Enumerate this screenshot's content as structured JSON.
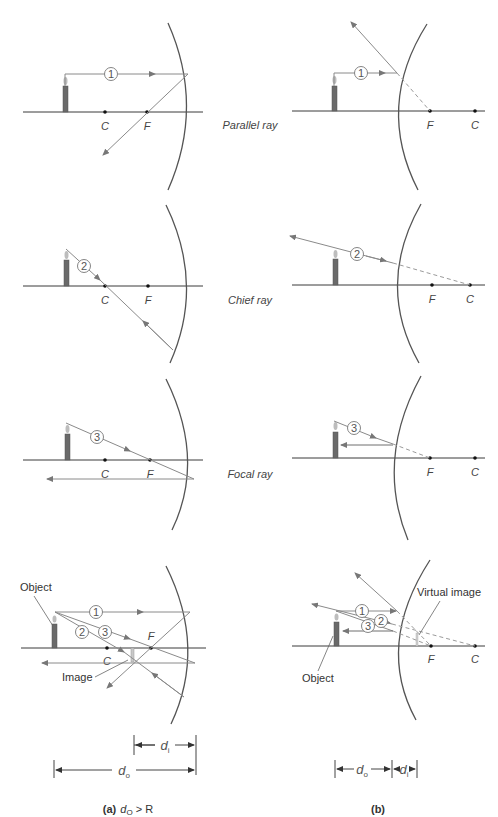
{
  "ray_labels": {
    "parallel": "Parallel ray",
    "chief": "Chief ray",
    "focal": "Focal ray"
  },
  "ray_numbers": {
    "one": "1",
    "two": "2",
    "three": "3"
  },
  "points": {
    "center": "C",
    "focus": "F"
  },
  "callouts": {
    "object": "Object",
    "image": "Image",
    "virtual_image": "Virtual image"
  },
  "dimensions": {
    "d": "d",
    "o_sub": "o",
    "i_sub": "i"
  },
  "captions": {
    "a_tag": "(a)",
    "a_condition_d": "d",
    "a_condition_sub": "O",
    "a_condition_rest": " > R",
    "b_tag": "(b)"
  },
  "colors": {
    "axis": "#3a3a3a",
    "ray": "#8a8a8a",
    "mirror": "#555555",
    "candle": "#6a6a6a"
  }
}
